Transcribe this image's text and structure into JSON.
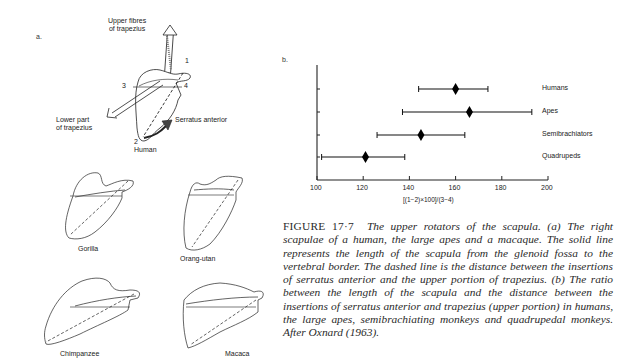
{
  "panel_a": {
    "label": "a.",
    "human": {
      "name": "Human",
      "annotations": {
        "upper_fibres": [
          "Upper fibres",
          "of trapezius"
        ],
        "lower_part": [
          "Lower part",
          "of trapezius"
        ],
        "serratus": "Serratus anterior",
        "point_1": "1",
        "point_2": "2",
        "point_3": "3",
        "point_4": "4"
      }
    },
    "specimens": [
      {
        "name": "Gorilla"
      },
      {
        "name": "Orang-utan"
      },
      {
        "name": "Chimpanzee"
      },
      {
        "name": "Macaca"
      }
    ]
  },
  "panel_b": {
    "label": "b."
  },
  "chart_data": {
    "type": "scatter",
    "subtype": "range-with-mean (diamond marker with horizontal whiskers)",
    "title": "",
    "xlabel": "[(1−2)×100]/(3−4)",
    "ylabel": "",
    "xlim": [
      100,
      200
    ],
    "xticks": [
      100,
      120,
      140,
      160,
      180,
      200
    ],
    "grid": false,
    "legend_position": "right (category labels)",
    "categories": [
      "Humans",
      "Apes",
      "Semibrachiators",
      "Quadrupeds"
    ],
    "series": [
      {
        "name": "mean",
        "values": [
          160,
          166,
          145,
          121
        ]
      },
      {
        "name": "range_min",
        "values": [
          144,
          137,
          126,
          102
        ]
      },
      {
        "name": "range_max",
        "values": [
          174,
          193,
          164,
          138
        ]
      }
    ]
  },
  "caption": {
    "figure_number": "FIGURE 17·7",
    "text": "The upper rotators of the scapula. (a) The right scapulae of a human, the large apes and a macaque. The solid line represents the length of the scapula from the glenoid fossa to the vertebral border. The dashed line is the distance between the insertions of serratus anterior and the upper portion of trapezius. (b) The ratio between the length of the scapula and the distance between the insertions of serratus anterior and trapezius (upper portion) in humans, the large apes, semibrachiating monkeys and quadrupedal monkeys. After Oxnard (1963)."
  }
}
